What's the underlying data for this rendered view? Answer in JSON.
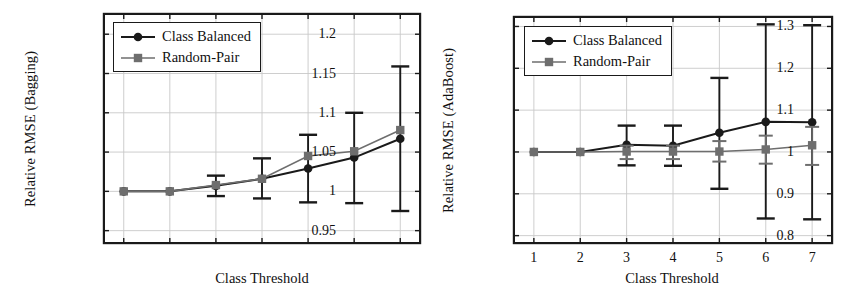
{
  "figure": {
    "background": "#ffffff",
    "series_colors": {
      "class_balanced": "#1a1a1a",
      "random_pair": "#6e6e6e"
    },
    "grid_color": "#c8c8c8",
    "frame_color": "#1a1a1a"
  },
  "legend": {
    "entries": [
      {
        "label": "Class Balanced",
        "marker": "circle",
        "color": "#1a1a1a"
      },
      {
        "label": "Random-Pair",
        "marker": "square",
        "color": "#6e6e6e"
      }
    ]
  },
  "chart_data": [
    {
      "id": "bagging",
      "type": "line",
      "title": "",
      "xlabel": "Class Threshold",
      "ylabel": "Relative RMSE (Bagging)",
      "x": [
        1,
        2,
        3,
        4,
        5,
        6,
        7
      ],
      "xticklabels": [
        "",
        "",
        "",
        "",
        "",
        "",
        ""
      ],
      "xlim": [
        0.55,
        7.45
      ],
      "ylim": [
        0.933,
        1.227
      ],
      "yticks": [
        0.95,
        1,
        1.05,
        1.1,
        1.15,
        1.2
      ],
      "yticklabels": [
        "0.95",
        "1",
        "1.05",
        "1.1",
        "1.15",
        "1.2"
      ],
      "grid": true,
      "legend_position": "upper left",
      "series": [
        {
          "name": "Class Balanced",
          "marker": "circle",
          "color": "#1a1a1a",
          "values": [
            1.0,
            1.0,
            1.007,
            1.016,
            1.029,
            1.043,
            1.067
          ],
          "err_low": [
            1.0,
            1.0,
            0.994,
            0.991,
            0.986,
            0.985,
            0.975
          ],
          "err_high": [
            1.0,
            1.0,
            1.02,
            1.042,
            1.072,
            1.1,
            1.159
          ]
        },
        {
          "name": "Random-Pair",
          "marker": "square",
          "color": "#6e6e6e",
          "values": [
            1.0,
            1.0,
            1.008,
            1.016,
            1.045,
            1.051,
            1.078
          ],
          "err_low": [
            1.0,
            1.0,
            1.008,
            1.016,
            1.045,
            1.051,
            1.078
          ],
          "err_high": [
            1.0,
            1.0,
            1.008,
            1.016,
            1.045,
            1.051,
            1.078
          ]
        }
      ]
    },
    {
      "id": "adaboost",
      "type": "line",
      "title": "",
      "xlabel": "Class Threshold",
      "ylabel": "Relative RMSE (AdaBoost)",
      "x": [
        1,
        2,
        3,
        4,
        5,
        6,
        7
      ],
      "xticklabels": [
        "1",
        "2",
        "3",
        "4",
        "5",
        "6",
        "7"
      ],
      "xlim": [
        0.55,
        7.45
      ],
      "ylim": [
        0.78,
        1.325
      ],
      "yticks": [
        0.8,
        0.9,
        1,
        1.1,
        1.2,
        1.3
      ],
      "yticklabels": [
        "0.8",
        "0.9",
        "1",
        "1.1",
        "1.2",
        "1.3"
      ],
      "grid": true,
      "legend_position": "upper left",
      "series": [
        {
          "name": "Class Balanced",
          "marker": "circle",
          "color": "#1a1a1a",
          "values": [
            1.0,
            1.0,
            1.017,
            1.015,
            1.046,
            1.072,
            1.071
          ],
          "err_low": [
            1.0,
            1.0,
            0.968,
            0.967,
            0.912,
            0.841,
            0.839
          ],
          "err_high": [
            1.0,
            1.0,
            1.063,
            1.063,
            1.177,
            1.305,
            1.303
          ]
        },
        {
          "name": "Random-Pair",
          "marker": "square",
          "color": "#6e6e6e",
          "values": [
            1.0,
            1.0,
            1.001,
            1.001,
            1.001,
            1.006,
            1.016
          ],
          "err_low": [
            1.0,
            1.0,
            0.983,
            0.983,
            0.977,
            0.972,
            0.969
          ],
          "err_high": [
            1.0,
            1.0,
            1.015,
            1.015,
            1.026,
            1.039,
            1.06
          ]
        }
      ]
    }
  ]
}
